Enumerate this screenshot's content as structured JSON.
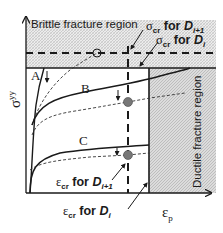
{
  "diagram": {
    "y_axis_label": "σ",
    "y_axis_sup": "yy",
    "x_axis_label": "ε",
    "x_axis_sub": "p",
    "regions": {
      "brittle": "Brittle fracture region",
      "ductile": "Ductile fracture region"
    },
    "curve_labels": {
      "a": "A",
      "b": "B",
      "c": "C"
    },
    "annotations": {
      "sigma_cr_next": {
        "symbol": "σ",
        "sub": "cr",
        "text": " for ",
        "D": "D",
        "index": "i+1"
      },
      "sigma_cr_i": {
        "symbol": "σ",
        "sub": "cr",
        "text": " for ",
        "D": "D",
        "index": "i"
      },
      "eps_cr_next": {
        "symbol": "ε",
        "sub": "cr",
        "text": " for ",
        "D": "D",
        "index": "i+1"
      },
      "eps_cr_i": {
        "symbol": "ε",
        "sub": "cr",
        "text": " for ",
        "D": "D",
        "index": "i"
      }
    },
    "colors": {
      "line": "#1a1a1a",
      "hatch_bg": "#e8e8e8",
      "point_fill": "#777777"
    }
  }
}
